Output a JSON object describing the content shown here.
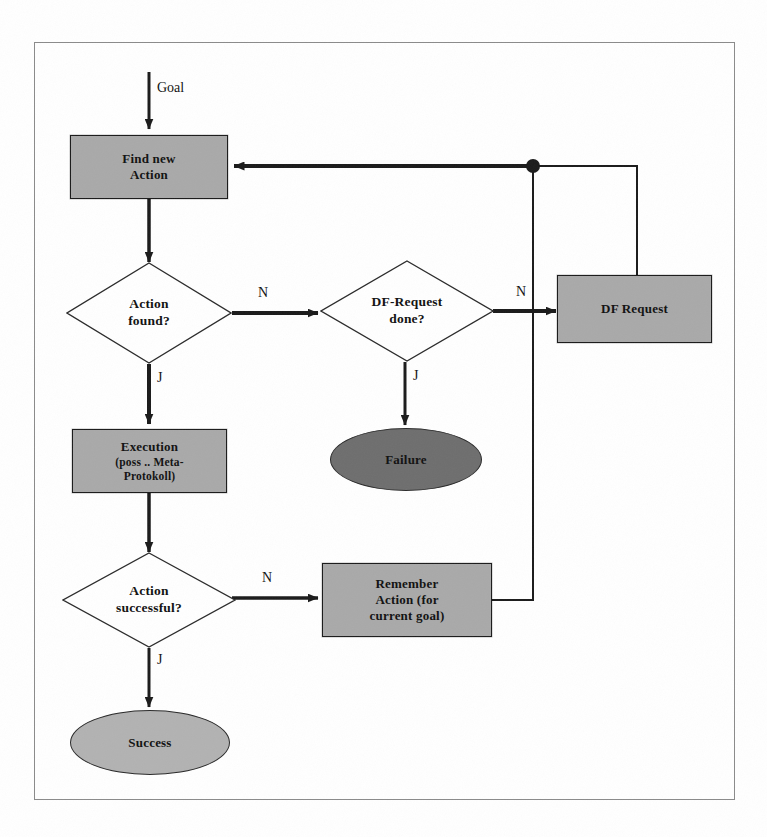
{
  "diagram": {
    "colors": {
      "process_fill": "#a9a9a9",
      "failure_fill": "#6e6e6e",
      "success_fill": "#b2b2b2",
      "line": "#1a1a1a",
      "frame": "#8a8a8a",
      "background": "#ffffff"
    },
    "nodes": {
      "goal_label": "Goal",
      "find_new_action": {
        "line1": "Find new",
        "line2": "Action"
      },
      "action_found": {
        "line1": "Action",
        "line2": "found?"
      },
      "df_request_done": {
        "line1": "DF-Request",
        "line2": "done?"
      },
      "df_request": {
        "line1": "DF Request"
      },
      "execution": {
        "line1": "Execution",
        "line2": "(poss .. Meta-",
        "line3": "Protokoll)"
      },
      "failure": {
        "line1": "Failure"
      },
      "action_successful": {
        "line1": "Action",
        "line2": "successful?"
      },
      "remember_action": {
        "line1": "Remember",
        "line2": "Action (for",
        "line3": "current goal)"
      },
      "success": {
        "line1": "Success"
      }
    },
    "edge_labels": {
      "action_found_no": "N",
      "action_found_yes": "J",
      "df_request_done_no": "N",
      "df_request_done_yes": "J",
      "action_successful_no": "N",
      "action_successful_yes": "J"
    }
  }
}
